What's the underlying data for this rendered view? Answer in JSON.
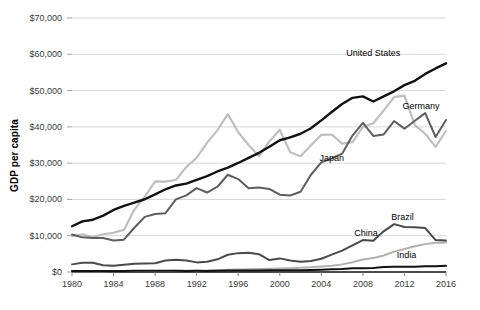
{
  "chart_data": {
    "type": "line",
    "title": "",
    "xlabel": "",
    "ylabel": "GDP per capita",
    "x": [
      1980,
      1981,
      1982,
      1983,
      1984,
      1985,
      1986,
      1987,
      1988,
      1989,
      1990,
      1991,
      1992,
      1993,
      1994,
      1995,
      1996,
      1997,
      1998,
      1999,
      2000,
      2001,
      2002,
      2003,
      2004,
      2005,
      2006,
      2007,
      2008,
      2009,
      2010,
      2011,
      2012,
      2013,
      2014,
      2015,
      2016
    ],
    "xlim": [
      1980,
      2016
    ],
    "ylim": [
      0,
      70000
    ],
    "xticks": [
      "1980",
      "1984",
      "1988",
      "1992",
      "1996",
      "2000",
      "2004",
      "2008",
      "2012",
      "2016"
    ],
    "yticks": [
      "$0",
      "$10,000",
      "$20,000",
      "$30,000",
      "$40,000",
      "$50,000",
      "$60,000",
      "$70,000"
    ],
    "ytick_values": [
      0,
      10000,
      20000,
      30000,
      40000,
      50000,
      60000,
      70000
    ],
    "grid": true,
    "grid_axis": "y",
    "legend": "inline-labels-right",
    "series": [
      {
        "name": "United States",
        "color": "#111111",
        "width": 2.4,
        "label_x": 2009.0,
        "label_y": 60500,
        "values": [
          12600,
          13950,
          14400,
          15550,
          17100,
          18250,
          19100,
          20050,
          21400,
          22800,
          23850,
          24350,
          25400,
          26400,
          27700,
          28750,
          30050,
          31450,
          32850,
          34500,
          36300,
          37100,
          38100,
          39600,
          41800,
          44100,
          46300,
          48000,
          48400,
          47000,
          48400,
          49800,
          51500,
          52700,
          54600,
          56100,
          57500
        ]
      },
      {
        "name": "Germany",
        "color": "#5e5e5e",
        "width": 2.0,
        "label_x": 2013.6,
        "label_y": 45700,
        "values": [
          10350,
          9550,
          9350,
          9350,
          8700,
          8900,
          12200,
          15200,
          16000,
          16200,
          20000,
          21100,
          23100,
          21900,
          23500,
          26800,
          25600,
          23100,
          23300,
          22900,
          21300,
          21100,
          22100,
          26800,
          30200,
          31300,
          32600,
          37600,
          41100,
          37500,
          37900,
          41600,
          39500,
          41700,
          43800,
          37200,
          41900
        ]
      },
      {
        "name": "Japan",
        "color": "#bfbfbf",
        "width": 2.2,
        "label_x": 2005.0,
        "label_y": 31500,
        "values": [
          9900,
          10400,
          9600,
          10400,
          10800,
          11600,
          17200,
          20700,
          25000,
          24900,
          25400,
          28900,
          31500,
          35600,
          39100,
          43500,
          38500,
          35000,
          31900,
          36000,
          39200,
          33000,
          31900,
          34900,
          37800,
          37900,
          35400,
          35800,
          40000,
          41000,
          44500,
          48200,
          48600,
          40500,
          38100,
          34500,
          38900
        ]
      },
      {
        "name": "Brazil",
        "color": "#4a4a4a",
        "width": 2.0,
        "label_x": 2011.8,
        "label_y": 15200,
        "values": [
          2100,
          2550,
          2550,
          1850,
          1750,
          2000,
          2300,
          2350,
          2400,
          3150,
          3350,
          3150,
          2650,
          2850,
          3500,
          4750,
          5200,
          5300,
          4900,
          3300,
          3750,
          3150,
          2850,
          3050,
          3650,
          4800,
          5900,
          7350,
          8800,
          8600,
          11200,
          13200,
          12400,
          12300,
          12100,
          8800,
          8700
        ]
      },
      {
        "name": "China",
        "color": "#b0b0b0",
        "width": 2.0,
        "label_x": 2008.3,
        "label_y": 10700,
        "values": [
          195,
          200,
          205,
          230,
          250,
          295,
          280,
          255,
          285,
          310,
          320,
          335,
          370,
          380,
          470,
          610,
          710,
          780,
          830,
          870,
          950,
          1050,
          1150,
          1290,
          1500,
          1750,
          2100,
          2700,
          3470,
          3830,
          4550,
          5620,
          6330,
          7080,
          7680,
          8070,
          8120
        ]
      },
      {
        "name": "India",
        "color": "#111111",
        "width": 2.0,
        "label_x": 2012.2,
        "label_y": 4700,
        "values": [
          270,
          275,
          280,
          295,
          280,
          305,
          320,
          350,
          370,
          350,
          370,
          305,
          320,
          300,
          350,
          380,
          410,
          420,
          420,
          450,
          450,
          460,
          480,
          550,
          640,
          730,
          810,
          1060,
          1000,
          1100,
          1360,
          1460,
          1440,
          1450,
          1570,
          1610,
          1710
        ]
      }
    ]
  }
}
